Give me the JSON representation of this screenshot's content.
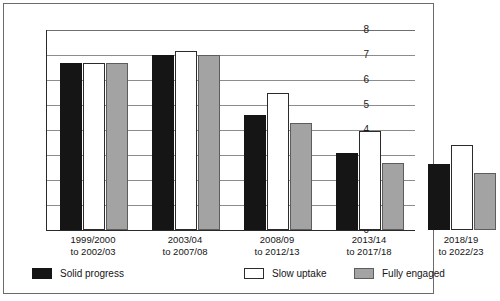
{
  "chart_data": {
    "type": "bar",
    "title": "",
    "subtitle": "",
    "xlabel": "",
    "ylabel": "",
    "ylim": [
      0,
      8
    ],
    "ytick_labels": [
      "0",
      "1",
      "2",
      "3",
      "4",
      "5",
      "6",
      "7",
      "8"
    ],
    "ytick_values": [
      0,
      1,
      2,
      3,
      4,
      5,
      6,
      7,
      8
    ],
    "grid": true,
    "legend_position": "bottom",
    "categories": [
      "1999/2000 to 2002/03",
      "2003/04 to 2007/08",
      "2008/09 to 2012/13",
      "2013/14 to 2017/18",
      "2018/19 to 2022/23"
    ],
    "category_lines": [
      [
        "1999/2000",
        "to 2002/03"
      ],
      [
        "2003/04",
        "to 2007/08"
      ],
      [
        "2008/09",
        "to 2012/13"
      ],
      [
        "2013/14",
        "to 2017/18"
      ],
      [
        "2018/19",
        "to 2022/23"
      ]
    ],
    "series": [
      {
        "name": "Solid progress",
        "color": "#151515",
        "values": [
          6.7,
          7.0,
          4.6,
          3.1,
          2.65
        ]
      },
      {
        "name": "Slow uptake",
        "color": "#ffffff",
        "values": [
          6.7,
          7.15,
          5.5,
          3.95,
          3.4
        ]
      },
      {
        "name": "Fully engaged",
        "color": "#a3a3a3",
        "values": [
          6.7,
          7.0,
          4.3,
          2.7,
          2.3
        ]
      }
    ]
  },
  "legend": {
    "items": [
      {
        "label": "Solid progress"
      },
      {
        "label": "Slow uptake"
      },
      {
        "label": "Fully engaged"
      }
    ]
  },
  "axis": {
    "y_labels": [
      "8",
      "7",
      "6",
      "5",
      "4",
      "3",
      "2",
      "1",
      "0"
    ]
  }
}
